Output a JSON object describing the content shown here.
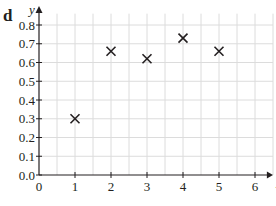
{
  "panel_label": "d",
  "chart_data": {
    "type": "scatter",
    "title": "",
    "xlabel": "x",
    "ylabel": "y",
    "xlim": [
      0,
      6.3
    ],
    "ylim": [
      0,
      0.85
    ],
    "grid": true,
    "grid_step": {
      "x": 0.5,
      "y": 0.1
    },
    "x_ticks": [
      "0",
      "1",
      "2",
      "3",
      "4",
      "5",
      "6"
    ],
    "y_ticks": [
      "0.0",
      "0.1",
      "0.2",
      "0.3",
      "0.4",
      "0.5",
      "0.6",
      "0.7",
      "0.8"
    ],
    "marker": "x",
    "points": [
      {
        "x": 1,
        "y": 0.3
      },
      {
        "x": 2,
        "y": 0.66
      },
      {
        "x": 3,
        "y": 0.62
      },
      {
        "x": 4,
        "y": 0.73
      },
      {
        "x": 5,
        "y": 0.66
      }
    ],
    "colors": {
      "axis": "#231f20",
      "grid": "#dcdcdc",
      "marker": "#231f20"
    }
  }
}
